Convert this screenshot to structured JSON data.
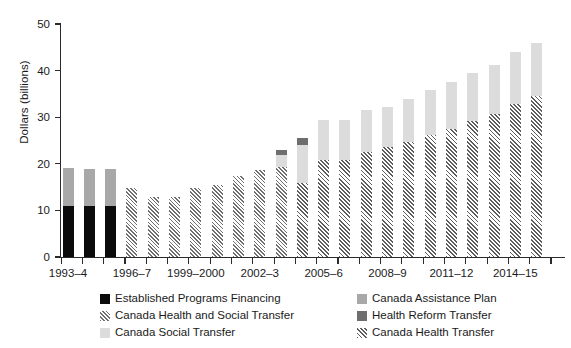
{
  "chart_data": {
    "type": "bar",
    "stacked": true,
    "title": "",
    "subtitle": "",
    "xlabel": "",
    "ylabel": "Dollars (billions)",
    "ylim": [
      0,
      50
    ],
    "yticks": [
      0,
      10,
      20,
      30,
      40,
      50
    ],
    "ytick_labels": [
      "0",
      "10",
      "20",
      "30",
      "40",
      "50"
    ],
    "grid": false,
    "legend_position": "bottom",
    "categories": [
      "1993–4",
      "1994–5",
      "1995–6",
      "1996–7",
      "1997–8",
      "1998–9",
      "1999–2000",
      "2000–1",
      "2001–2",
      "2002–3",
      "2003–4",
      "2004–5",
      "2005–6",
      "2006–7",
      "2007–8",
      "2008–9",
      "2009–10",
      "2010–11",
      "2011–12",
      "2012–13",
      "2013–14",
      "2014–15",
      "2015–16"
    ],
    "xtick_labels_shown": [
      "1993–4",
      "1996–7",
      "1999–2000",
      "2002–3",
      "2005–6",
      "2008–9",
      "2011–12",
      "2014–15"
    ],
    "series": [
      {
        "name": "Established Programs Financing",
        "key": "epf",
        "color": "#0b0b0b",
        "pattern": "solid",
        "values": [
          11.0,
          10.9,
          10.9,
          0,
          0,
          0,
          0,
          0,
          0,
          0,
          0,
          0,
          0,
          0,
          0,
          0,
          0,
          0,
          0,
          0,
          0,
          0,
          0
        ]
      },
      {
        "name": "Canada Assistance Plan",
        "key": "cap",
        "color": "#a8a8a8",
        "pattern": "solid",
        "values": [
          8.0,
          7.9,
          7.9,
          0,
          0,
          0,
          0,
          0,
          0,
          0,
          0,
          0,
          0,
          0,
          0,
          0,
          0,
          0,
          0,
          0,
          0,
          0,
          0
        ]
      },
      {
        "name": "Canada Health and Social Transfer",
        "key": "chst",
        "color": "#6f6f6f",
        "pattern": "hatch",
        "values": [
          0,
          0,
          0,
          14.9,
          12.9,
          12.9,
          14.8,
          15.5,
          17.3,
          18.7,
          19.4,
          0,
          0,
          0,
          0,
          0,
          0,
          0,
          0,
          0,
          0,
          0,
          0
        ]
      },
      {
        "name": "Canada Health Transfer",
        "key": "cht",
        "color": "#5d5d5d",
        "pattern": "hatch",
        "values": [
          0,
          0,
          0,
          0,
          0,
          0,
          0,
          0,
          0,
          0,
          0,
          15.9,
          20.9,
          20.8,
          22.6,
          23.6,
          24.7,
          26.2,
          27.5,
          29.1,
          30.6,
          32.9,
          34.5
        ]
      },
      {
        "name": "Canada Social Transfer",
        "key": "cst",
        "color": "#dcdcdc",
        "pattern": "solid",
        "values": [
          0,
          0,
          0,
          0,
          0,
          0,
          0,
          0,
          0,
          0,
          2.5,
          8.2,
          8.4,
          8.5,
          9.0,
          8.5,
          9.2,
          9.6,
          10.0,
          10.3,
          10.7,
          11.1,
          11.5
        ],
        "note": "2003–4 topmost segment is the dark Health Reform Transfer cap; CST begins 2004–5"
      },
      {
        "name": "Health Reform Transfer",
        "key": "hrt",
        "color": "#6e6e6e",
        "pattern": "solid",
        "values": [
          0,
          0,
          0,
          0,
          0,
          0,
          0,
          0,
          0,
          0,
          1.0,
          1.5,
          0,
          0,
          0,
          0,
          0,
          0,
          0,
          0,
          0,
          0,
          0
        ]
      }
    ],
    "totals": [
      19.0,
      18.8,
      18.8,
      14.9,
      12.9,
      12.9,
      14.8,
      15.5,
      17.3,
      18.7,
      20.4,
      25.6,
      29.3,
      29.3,
      31.6,
      32.1,
      33.9,
      35.8,
      37.5,
      39.4,
      41.3,
      44.0,
      46.0
    ],
    "legend": [
      {
        "label": "Established Programs Financing",
        "key": "epf",
        "column": "left"
      },
      {
        "label": "Canada Health and Social Transfer",
        "key": "chst",
        "column": "left"
      },
      {
        "label": "Canada Social Transfer",
        "key": "cst",
        "column": "left"
      },
      {
        "label": "Canada Assistance Plan",
        "key": "cap",
        "column": "right"
      },
      {
        "label": "Health Reform Transfer",
        "key": "hrt",
        "column": "right"
      },
      {
        "label": "Canada Health Transfer",
        "key": "cht",
        "column": "right"
      }
    ],
    "colors": {
      "established_programs_financing": "#0b0b0b",
      "canada_assistance_plan": "#a8a8a8",
      "canada_health_and_social_transfer": "#6f6f6f",
      "canada_social_transfer": "#dcdcdc",
      "health_reform_transfer": "#6e6e6e",
      "canada_health_transfer": "#5d5d5d",
      "axis": "#2b2b2b",
      "background": "#ffffff"
    }
  }
}
